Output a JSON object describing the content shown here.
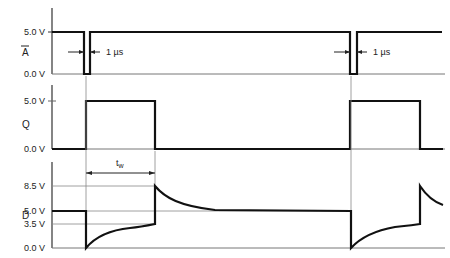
{
  "diagram": {
    "type": "timing-diagram",
    "signals": [
      {
        "name": "A",
        "overbar": true,
        "ticks": [
          "5.0 V",
          "0.0 V"
        ],
        "description": "Active-low trigger pulses of 1 µs width"
      },
      {
        "name": "Q",
        "overbar": false,
        "ticks": [
          "5.0 V",
          "0.0 V"
        ],
        "description": "One-shot output pulse of width t_w"
      },
      {
        "name": "D",
        "overbar": false,
        "ticks": [
          "8.5 V",
          "5.0 V",
          "3.5 V",
          "0.0 V"
        ],
        "description": "Timing capacitor node voltage with exponential charge and decay"
      }
    ],
    "annotations": {
      "pulse_width_1": "1 µs",
      "pulse_width_2": "1 µs",
      "tw_base": "t",
      "tw_sub": "w"
    },
    "colors": {
      "trace": "#111111",
      "axis": "#333333",
      "guide": "#888888",
      "background": "#ffffff"
    }
  }
}
